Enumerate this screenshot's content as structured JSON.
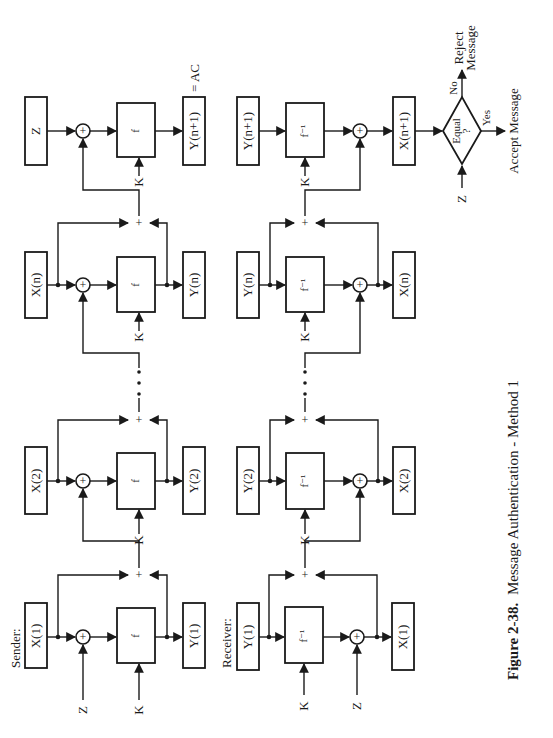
{
  "figure": {
    "number": "Figure 2-38.",
    "title": "Message Authentication - Method 1",
    "orientation": "rotated 90° counter-clockwise"
  },
  "sender": {
    "label": "Sender:",
    "stages": [
      {
        "input": "X(1)",
        "fn": "f",
        "output": "Y(1)",
        "xor_input": "Z",
        "key": "K"
      },
      {
        "input": "X(2)",
        "fn": "f",
        "output": "Y(2)",
        "key": "K"
      },
      {
        "input": "X(n)",
        "fn": "f",
        "output": "Y(n)",
        "key": "K"
      },
      {
        "input": "Z",
        "fn": "f",
        "output": "Y(n+1)",
        "key": "K",
        "output_note": "= AC"
      }
    ]
  },
  "receiver": {
    "label": "Receiver:",
    "stages": [
      {
        "input": "Y(1)",
        "fn": "f⁻¹",
        "output": "X(1)",
        "xor_input": "Z",
        "key": "K"
      },
      {
        "input": "Y(2)",
        "fn": "f⁻¹",
        "output": "X(2)",
        "key": "K"
      },
      {
        "input": "Y(n)",
        "fn": "f⁻¹",
        "output": "X(n)",
        "key": "K"
      },
      {
        "input": "Y(n+1)",
        "fn": "f⁻¹",
        "output": "X(n+1)",
        "key": "K"
      }
    ]
  },
  "decision": {
    "text_line1": "Equal",
    "text_line2": "?",
    "compare_input": "Z",
    "yes_label": "Yes",
    "no_label": "No",
    "yes_outcome": "Accept Message",
    "no_outcome_line1": "Reject",
    "no_outcome_line2": "Message"
  },
  "symbols": {
    "xor": "+",
    "junction": "+",
    "ellipsis": "•••"
  }
}
